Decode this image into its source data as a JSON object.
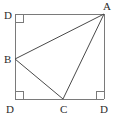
{
  "figure": {
    "kind": "geometry-diagram",
    "background_color": "#ffffff",
    "stroke_color": "#7a7a7a",
    "inner_stroke_color": "#4a4a4a",
    "label_color": "#2b2b2b",
    "stroke_width": 1,
    "square": {
      "name": "outer-square",
      "left": 15,
      "top": 14,
      "right": 104,
      "bottom": 99
    },
    "points": {
      "top_left": {
        "x": 15,
        "y": 14
      },
      "top_right": {
        "x": 104,
        "y": 14
      },
      "bottom_left": {
        "x": 15,
        "y": 99
      },
      "bottom_right": {
        "x": 104,
        "y": 99
      },
      "B": {
        "x": 15,
        "y": 59
      },
      "C": {
        "x": 63,
        "y": 99
      }
    },
    "triangle": {
      "name": "triangle-ABC",
      "vertices": [
        "A",
        "B",
        "C"
      ]
    },
    "labels": [
      {
        "id": "label-top-left",
        "text": "D",
        "x": 4,
        "y": 10
      },
      {
        "id": "label-top-right",
        "text": "A",
        "x": 103,
        "y": 1
      },
      {
        "id": "label-left",
        "text": "B",
        "x": 4,
        "y": 54
      },
      {
        "id": "label-bottom-left",
        "text": "D",
        "x": 6,
        "y": 104
      },
      {
        "id": "label-bottom-mid",
        "text": "C",
        "x": 60,
        "y": 104
      },
      {
        "id": "label-bottom-right",
        "text": "D",
        "x": 100,
        "y": 104
      }
    ],
    "right_angle_markers": [
      {
        "id": "right-angle-top-left",
        "corner": "top_left",
        "size": 8
      },
      {
        "id": "right-angle-bottom-left",
        "corner": "bottom_left",
        "size": 8
      },
      {
        "id": "right-angle-bottom-right",
        "corner": "bottom_right",
        "size": 8
      }
    ]
  }
}
